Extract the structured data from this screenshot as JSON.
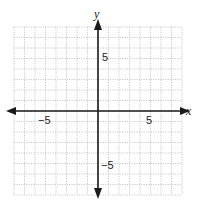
{
  "chart_data": {
    "type": "coordinate_grid",
    "title": "",
    "xlabel": "x",
    "ylabel": "y",
    "xlim": [
      -8,
      8
    ],
    "ylim": [
      -8,
      8
    ],
    "grid": true,
    "grid_step": 1,
    "x_tick_labels": [
      {
        "value": -5,
        "label": "−5"
      },
      {
        "value": 5,
        "label": "5"
      }
    ],
    "y_tick_labels": [
      {
        "value": 5,
        "label": "5"
      },
      {
        "value": -5,
        "label": "−5"
      }
    ],
    "series": []
  },
  "axes": {
    "x_label": "x",
    "y_label": "y",
    "x_neg5": "−5",
    "x_pos5": "5",
    "y_pos5": "5",
    "y_neg5": "−5"
  },
  "colors": {
    "grid": "#bdbdbd",
    "axis": "#1a1a1a"
  }
}
